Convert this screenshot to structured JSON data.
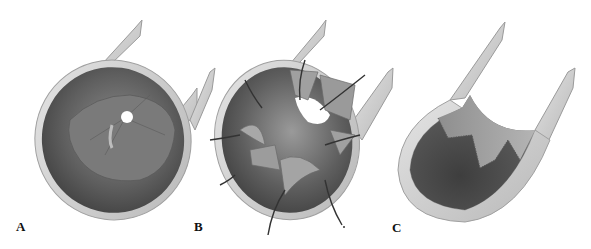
{
  "figure": {
    "panels": [
      {
        "id": "A",
        "label": "A",
        "description": "Cut-away tube showing inner membrane with small central aperture"
      },
      {
        "id": "B",
        "label": "B",
        "description": "Cut-away tube with membrane flaps retracted by sutures"
      },
      {
        "id": "C",
        "label": "C",
        "description": "Cut-away opened tube showing zigzag incision line on inner wall"
      }
    ],
    "colors": {
      "background": "#ffffff",
      "tube_outer": "#d6d6d6",
      "tube_edge": "#9a9a9a",
      "lumen_dark": "#4a4a4a",
      "lumen_mid": "#6e6e6e",
      "membrane": "#8a8a8a",
      "suture": "#333333",
      "label": "#111111"
    }
  }
}
